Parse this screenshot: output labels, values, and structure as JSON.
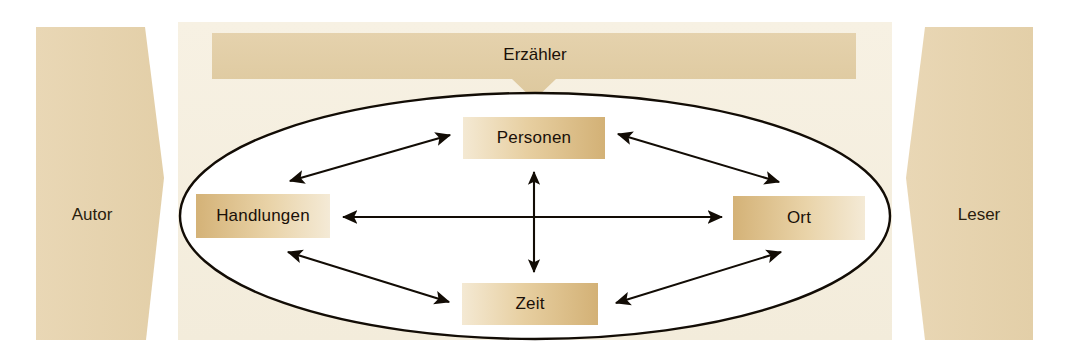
{
  "diagram": {
    "canvas": {
      "width": 1070,
      "height": 363,
      "background": "#ffffff"
    },
    "colors": {
      "panel_bg": "#f6efdf",
      "side_shape": "#e7d4b0",
      "narrator_bar": "#e2cfa9",
      "box_gold": "#d8b97e",
      "box_light": "#f3e7cf",
      "outline": "#1a1208",
      "text": "#1a1008"
    },
    "outer_left": {
      "label": "Autor",
      "name": "autor-shape"
    },
    "outer_right": {
      "label": "Leser",
      "name": "leser-shape"
    },
    "narrator": {
      "label": "Erzähler",
      "name": "erzaehler-bar"
    },
    "ellipse": {
      "name": "story-world-ellipse",
      "cx": 535,
      "cy": 216,
      "rx": 355,
      "ry": 123
    },
    "nodes": [
      {
        "id": "personen",
        "label": "Personen",
        "x": 463,
        "y": 117,
        "w": 142,
        "h": 42,
        "gradient": "light-to-gold"
      },
      {
        "id": "handlungen",
        "label": "Handlungen",
        "x": 196,
        "y": 194,
        "w": 134,
        "h": 44,
        "gradient": "gold-to-light"
      },
      {
        "id": "ort",
        "label": "Ort",
        "x": 733,
        "y": 196,
        "w": 132,
        "h": 44,
        "gradient": "gold-to-light"
      },
      {
        "id": "zeit",
        "label": "Zeit",
        "x": 462,
        "y": 283,
        "w": 136,
        "h": 42,
        "gradient": "light-to-gold"
      }
    ],
    "connections": [
      {
        "from": "handlungen",
        "to": "personen",
        "style": "double-arrow"
      },
      {
        "from": "personen",
        "to": "ort",
        "style": "double-arrow"
      },
      {
        "from": "handlungen",
        "to": "zeit",
        "style": "double-arrow"
      },
      {
        "from": "zeit",
        "to": "ort",
        "style": "double-arrow"
      },
      {
        "from": "handlungen",
        "to": "ort",
        "style": "double-arrow-horizontal"
      },
      {
        "from": "personen",
        "to": "zeit",
        "style": "double-arrow-vertical"
      }
    ]
  }
}
